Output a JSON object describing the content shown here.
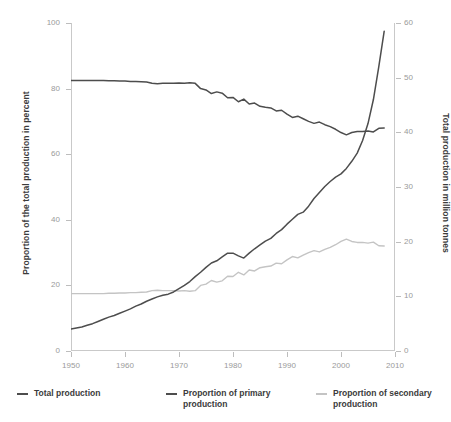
{
  "chart_data": {
    "type": "line",
    "title": "",
    "xlabel": "",
    "ylabel": "Proportion of the total production in percent",
    "ylabel_right": "Total production in million tonnes",
    "xlim": [
      1950,
      2010
    ],
    "ylim": [
      0,
      100
    ],
    "ylim_right": [
      0,
      60
    ],
    "grid": false,
    "legend_position": "bottom",
    "xticks": [
      1950,
      1960,
      1970,
      1980,
      1990,
      2000,
      2010
    ],
    "yticks_left": [
      0,
      20,
      40,
      60,
      80,
      100
    ],
    "yticks_right": [
      0,
      10,
      20,
      30,
      40,
      50,
      60
    ],
    "colors": {
      "total_production": "#4d4d4d",
      "primary_production": "#4d4d4d",
      "secondary_production": "#c4c4c4"
    },
    "x": [
      1950,
      1951,
      1952,
      1953,
      1954,
      1955,
      1956,
      1957,
      1958,
      1959,
      1960,
      1961,
      1962,
      1963,
      1964,
      1965,
      1966,
      1967,
      1968,
      1969,
      1970,
      1971,
      1972,
      1973,
      1974,
      1975,
      1976,
      1977,
      1978,
      1979,
      1980,
      1981,
      1982,
      1983,
      1984,
      1985,
      1986,
      1987,
      1988,
      1989,
      1990,
      1991,
      1992,
      1993,
      1994,
      1995,
      1996,
      1997,
      1998,
      1999,
      2000,
      2001,
      2002,
      2003,
      2004,
      2005,
      2006,
      2007,
      2008
    ],
    "series": [
      {
        "name": "Total production",
        "axis": "right",
        "unit": "million tonnes",
        "values": [
          4.0,
          4.2,
          4.4,
          4.7,
          5.0,
          5.4,
          5.8,
          6.2,
          6.5,
          6.9,
          7.3,
          7.7,
          8.2,
          8.6,
          9.1,
          9.5,
          9.9,
          10.2,
          10.4,
          10.8,
          11.4,
          12.0,
          12.7,
          13.6,
          14.4,
          15.3,
          16.1,
          16.5,
          17.2,
          17.9,
          17.9,
          17.4,
          17.0,
          17.9,
          18.7,
          19.4,
          20.1,
          20.6,
          21.5,
          22.2,
          23.2,
          24.1,
          25.0,
          25.4,
          26.5,
          27.9,
          29.0,
          30.1,
          31.0,
          31.8,
          32.4,
          33.4,
          34.7,
          36.2,
          38.5,
          41.6,
          46.0,
          52.0,
          58.5
        ]
      },
      {
        "name": "Proportion of primary production",
        "axis": "left",
        "unit": "percent",
        "values": [
          82.5,
          82.5,
          82.5,
          82.5,
          82.5,
          82.5,
          82.5,
          82.4,
          82.4,
          82.3,
          82.3,
          82.2,
          82.2,
          82.1,
          82.0,
          81.6,
          81.5,
          81.6,
          81.6,
          81.6,
          81.7,
          81.6,
          81.8,
          81.6,
          80.0,
          79.6,
          78.5,
          79.0,
          78.6,
          77.2,
          77.3,
          76.0,
          76.8,
          75.3,
          75.6,
          74.6,
          74.3,
          74.1,
          73.2,
          73.4,
          72.2,
          71.2,
          71.6,
          70.8,
          70.0,
          69.4,
          69.8,
          69.0,
          68.4,
          67.6,
          66.6,
          65.9,
          66.6,
          66.9,
          66.9,
          67.1,
          66.8,
          67.9,
          68.0
        ]
      },
      {
        "name": "Proportion of secondary production",
        "axis": "left",
        "unit": "percent",
        "values": [
          17.5,
          17.5,
          17.5,
          17.5,
          17.5,
          17.5,
          17.5,
          17.6,
          17.6,
          17.7,
          17.7,
          17.8,
          17.8,
          17.9,
          18.0,
          18.4,
          18.5,
          18.4,
          18.4,
          18.4,
          18.3,
          18.4,
          18.2,
          18.4,
          20.0,
          20.4,
          21.5,
          21.0,
          21.4,
          22.8,
          22.7,
          24.0,
          23.2,
          24.7,
          24.4,
          25.4,
          25.7,
          25.9,
          26.8,
          26.6,
          27.8,
          28.8,
          28.4,
          29.2,
          30.0,
          30.6,
          30.2,
          31.0,
          31.6,
          32.4,
          33.4,
          34.1,
          33.4,
          33.1,
          33.1,
          32.9,
          33.2,
          32.1,
          32.0
        ]
      }
    ]
  },
  "legend": {
    "items": [
      {
        "label": "Total production"
      },
      {
        "label": "Proportion of primary production"
      },
      {
        "label": "Proportion of secondary production"
      }
    ]
  }
}
